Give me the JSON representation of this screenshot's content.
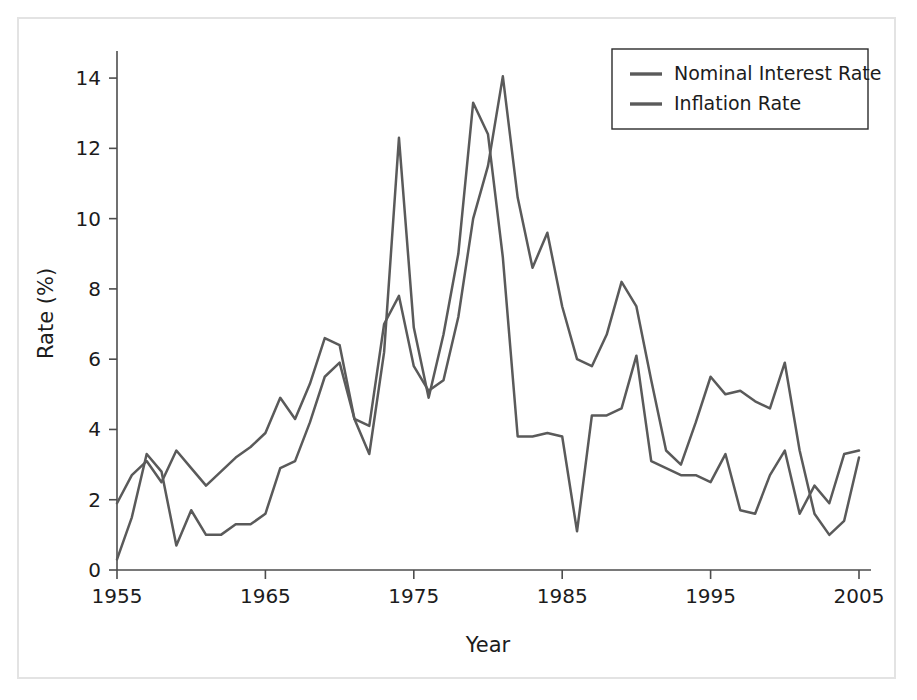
{
  "figure": {
    "border_color": "#e3e3e3",
    "background": "#ffffff"
  },
  "chart_data": {
    "type": "line",
    "title": "",
    "xlabel": "Year",
    "ylabel": "Rate (%)",
    "xlim": [
      1955,
      2005
    ],
    "ylim": [
      0,
      14.6
    ],
    "xticks": [
      1955,
      1965,
      1975,
      1985,
      1995,
      2005
    ],
    "yticks": [
      0,
      2,
      4,
      6,
      8,
      10,
      12,
      14
    ],
    "grid": false,
    "legend_position": "top-right",
    "x": [
      1955,
      1956,
      1957,
      1958,
      1959,
      1960,
      1961,
      1962,
      1963,
      1964,
      1965,
      1966,
      1967,
      1968,
      1969,
      1970,
      1971,
      1972,
      1973,
      1974,
      1975,
      1976,
      1977,
      1978,
      1979,
      1980,
      1981,
      1982,
      1983,
      1984,
      1985,
      1986,
      1987,
      1988,
      1989,
      1990,
      1991,
      1992,
      1993,
      1994,
      1995,
      1996,
      1997,
      1998,
      1999,
      2000,
      2001,
      2002,
      2003,
      2004,
      2005
    ],
    "series": [
      {
        "name": "Nominal Interest Rate",
        "color": "#5a5a5a",
        "values": [
          1.9,
          2.7,
          3.1,
          2.5,
          3.4,
          2.9,
          2.4,
          2.8,
          3.2,
          3.5,
          3.9,
          4.9,
          4.3,
          5.3,
          6.6,
          6.4,
          4.3,
          4.1,
          7.0,
          7.8,
          5.8,
          5.1,
          5.4,
          7.2,
          10.0,
          11.5,
          14.05,
          10.6,
          8.6,
          9.6,
          7.5,
          6.0,
          5.8,
          6.7,
          8.2,
          7.5,
          5.4,
          3.4,
          3.0,
          4.2,
          5.5,
          5.0,
          5.1,
          4.8,
          4.6,
          5.9,
          3.4,
          1.6,
          1.0,
          1.4,
          3.2
        ]
      },
      {
        "name": "Inflation Rate",
        "color": "#5a5a5a",
        "values": [
          0.3,
          1.5,
          3.3,
          2.8,
          0.7,
          1.7,
          1.0,
          1.0,
          1.3,
          1.3,
          1.6,
          2.9,
          3.1,
          4.2,
          5.5,
          5.9,
          4.3,
          3.3,
          6.2,
          12.3,
          6.9,
          4.9,
          6.7,
          9.0,
          13.3,
          12.4,
          8.9,
          3.8,
          3.8,
          3.9,
          3.8,
          1.1,
          4.4,
          4.4,
          4.6,
          6.1,
          3.1,
          2.9,
          2.7,
          2.7,
          2.5,
          3.3,
          1.7,
          1.6,
          2.7,
          3.4,
          1.6,
          2.4,
          1.9,
          3.3,
          3.4
        ]
      }
    ]
  },
  "legend": {
    "items": [
      {
        "label": "Nominal Interest Rate",
        "color": "#5a5a5a"
      },
      {
        "label": "Inflation Rate",
        "color": "#5a5a5a"
      }
    ]
  }
}
